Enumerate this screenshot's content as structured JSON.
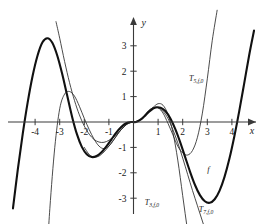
{
  "figure": {
    "background": "#ffffff",
    "ink": "#111111"
  },
  "axes": {
    "x_axis_label": "x",
    "y_axis_label": "y",
    "x_ticks": [
      "-4",
      "-3",
      "-2",
      "-1",
      "1",
      "2",
      "3",
      "4"
    ],
    "y_ticks": [
      "3",
      "2",
      "1",
      "-1",
      "-2",
      "-3"
    ],
    "xlim": [
      -4.9,
      4.9
    ],
    "ylim": [
      -3.9,
      3.8
    ],
    "grid": false,
    "arrow_on_x_positive": true,
    "arrow_on_y_positive": true
  },
  "labels": {
    "f": "f",
    "t3": "T",
    "t3_sub": "3,f,0",
    "t5": "T",
    "t5_sub": "5,f,0",
    "t7": "T",
    "t7_sub": "7,f,0"
  },
  "chart_data": {
    "type": "line",
    "title": "",
    "xlabel": "x",
    "ylabel": "y",
    "xlim": [
      -4.9,
      4.9
    ],
    "ylim": [
      -3.9,
      3.8
    ],
    "grid": false,
    "legend": "inline-curve-labels",
    "xticks": [
      -4,
      -3,
      -2,
      -1,
      1,
      2,
      3,
      4
    ],
    "yticks": [
      3,
      2,
      1,
      -1,
      -2,
      -3
    ],
    "annotations": [
      {
        "text": "f",
        "x": 3.05,
        "y": -1.95
      },
      {
        "text": "T5,f,0",
        "x": 2.55,
        "y": 1.62
      },
      {
        "text": "T3,f,0",
        "x": 0.75,
        "y": -3.25
      },
      {
        "text": "T7,f,0",
        "x": 2.95,
        "y": -3.55
      }
    ],
    "series": [
      {
        "name": "f",
        "style": "thick",
        "x": [
          -4.9,
          -4.7,
          -4.5,
          -4.3,
          -4.1,
          -3.9,
          -3.7,
          -3.5,
          -3.3,
          -3.1,
          -2.9,
          -2.7,
          -2.5,
          -2.3,
          -2.1,
          -1.9,
          -1.7,
          -1.5,
          -1.3,
          -1.1,
          -0.9,
          -0.7,
          -0.5,
          -0.3,
          -0.1,
          0.1,
          0.3,
          0.5,
          0.7,
          0.9,
          1.1,
          1.3,
          1.5,
          1.7,
          1.9,
          2.1,
          2.3,
          2.5,
          2.7,
          2.9,
          3.1,
          3.3,
          3.5,
          3.7,
          3.9,
          4.1,
          4.3,
          4.5,
          4.7,
          4.9
        ],
        "y": [
          -3.4,
          -1.85,
          -0.45,
          0.78,
          1.82,
          2.62,
          3.14,
          3.3,
          3.12,
          2.62,
          1.9,
          1.06,
          0.22,
          -0.48,
          -0.98,
          -1.27,
          -1.38,
          -1.34,
          -1.19,
          -0.96,
          -0.69,
          -0.42,
          -0.2,
          -0.05,
          0.0,
          0.0,
          0.1,
          0.28,
          0.46,
          0.57,
          0.56,
          0.42,
          0.14,
          -0.28,
          -0.8,
          -1.38,
          -1.96,
          -2.48,
          -2.88,
          -3.12,
          -3.18,
          -3.04,
          -2.7,
          -2.16,
          -1.44,
          -0.56,
          0.44,
          1.52,
          2.62,
          3.6
        ],
        "description": "thick solid curve, the function f"
      },
      {
        "name": "T3,f,0",
        "style": "thin",
        "x": [
          -3.15,
          -3.0,
          -2.8,
          -2.6,
          -2.4,
          -2.2,
          -2.0,
          -1.8,
          -1.6,
          -1.4,
          -1.2,
          -1.0,
          -0.8,
          -0.6,
          -0.4,
          -0.2,
          0.0,
          0.2,
          0.4,
          0.6,
          0.8,
          1.0,
          1.2,
          1.4,
          1.6,
          1.8,
          2.0,
          2.2,
          2.4,
          2.6
        ],
        "y": [
          3.95,
          3.3,
          2.38,
          1.55,
          0.85,
          0.28,
          -0.16,
          -0.48,
          -0.69,
          -0.79,
          -0.8,
          -0.72,
          -0.58,
          -0.4,
          -0.2,
          -0.04,
          0.0,
          0.04,
          0.2,
          0.4,
          0.58,
          0.72,
          0.66,
          0.3,
          -0.4,
          -1.5,
          -2.9,
          -4.3,
          -5.6,
          -6.6
        ],
        "description": "thin curve: 3rd order Taylor polynomial; steeply leaves f past |x|>1.5"
      },
      {
        "name": "T5,f,0",
        "style": "thin",
        "x": [
          -3.55,
          -3.4,
          -3.2,
          -3.0,
          -2.8,
          -2.6,
          -2.4,
          -2.2,
          -2.0,
          -1.8,
          -1.6,
          -1.4,
          -1.2,
          -1.0,
          -0.8,
          -0.6,
          -0.4,
          -0.2,
          0.0,
          0.2,
          0.4,
          0.6,
          0.8,
          1.0,
          1.2,
          1.4,
          1.6,
          1.8,
          2.0,
          2.2,
          2.4,
          2.6,
          2.8,
          3.0,
          3.2,
          3.4
        ],
        "y": [
          -5.8,
          -3.4,
          -1.0,
          0.52,
          1.1,
          1.2,
          1.02,
          0.62,
          0.14,
          -0.3,
          -0.68,
          -0.95,
          -1.05,
          -0.95,
          -0.7,
          -0.42,
          -0.19,
          -0.04,
          0.0,
          0.04,
          0.19,
          0.42,
          0.56,
          0.56,
          0.35,
          -0.05,
          -0.5,
          -0.95,
          -1.22,
          -1.3,
          -1.12,
          -0.6,
          0.35,
          1.7,
          3.2,
          4.4
        ],
        "description": "thin curve: 5th order Taylor polynomial; local min near x=2.3 at y=-1.3, rises steeply after x=3"
      },
      {
        "name": "T7,f,0",
        "style": "thin",
        "x": [
          -2.0,
          -1.8,
          -1.6,
          -1.4,
          -1.2,
          -1.0,
          -0.8,
          -0.6,
          -0.4,
          -0.2,
          0.0,
          0.2,
          0.4,
          0.6,
          0.8,
          1.0,
          1.2,
          1.4,
          1.6,
          1.8,
          2.0,
          2.2,
          2.4,
          2.6,
          2.8,
          3.0,
          3.2
        ],
        "y": [
          -1.0,
          -1.28,
          -1.38,
          -1.34,
          -1.18,
          -0.95,
          -0.69,
          -0.42,
          -0.2,
          -0.05,
          0.0,
          0.05,
          0.2,
          0.44,
          0.56,
          0.56,
          0.42,
          0.14,
          -0.3,
          -0.82,
          -1.42,
          -2.06,
          -2.7,
          -3.3,
          -3.9,
          -4.5,
          -5.1
        ],
        "description": "thin curve: 7th order Taylor polynomial; hugs f closely then drops below near x>2.6"
      }
    ]
  }
}
